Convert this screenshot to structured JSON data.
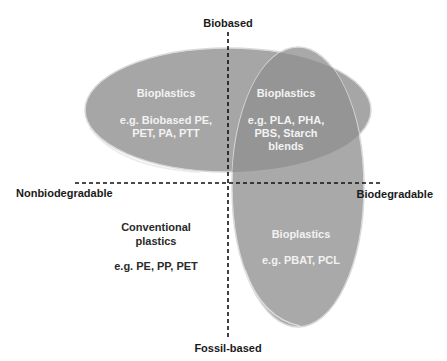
{
  "axes": {
    "top": "Biobased",
    "bottom": "Fossil-based",
    "left": "Nonbiodegradable",
    "right": "Biodegradable"
  },
  "regions": {
    "biobased_nonbiodegradable": {
      "title": "Bioplastics",
      "lines": [
        "e.g. Biobased PE,",
        "PET, PA, PTT"
      ]
    },
    "biobased_biodegradable": {
      "title": "Bioplastics",
      "lines": [
        "e.g. PLA, PHA,",
        "PBS, Starch",
        "blends"
      ]
    },
    "fossil_biodegradable": {
      "title": "Bioplastics",
      "lines": [
        "e.g. PBAT, PCL"
      ]
    },
    "fossil_nonbiodegradable": {
      "title_lines": [
        "Conventional",
        "plastics"
      ],
      "lines": [
        "e.g. PE, PP, PET"
      ]
    }
  },
  "colors": {
    "ellipse_fill": "#a6a6a6",
    "overlap_fill": "#959595",
    "ellipse_edge": "#d9d9d9",
    "axis": "#111111"
  }
}
